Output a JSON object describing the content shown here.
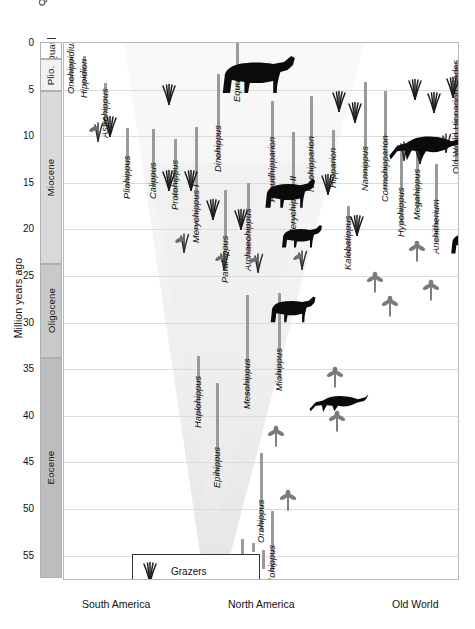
{
  "chart_data": {
    "type": "range_chart",
    "ylabel": "Million years ago",
    "ylim": [
      0,
      57.5
    ],
    "y_inverted": true,
    "yticks": [
      0,
      5,
      10,
      15,
      20,
      25,
      30,
      35,
      40,
      45,
      50,
      55
    ],
    "grid": true,
    "legend_position": "bottom-left",
    "xlabel": "",
    "x_regions": [
      "South America",
      "North America",
      "Old World"
    ],
    "epochs": [
      {
        "name": "Quat.",
        "start": 0.0,
        "end": 1.8,
        "shade": "#ffffff"
      },
      {
        "name": "Plio.",
        "start": 1.8,
        "end": 5.3,
        "shade": "#f2f2f2"
      },
      {
        "name": "Miocene",
        "start": 5.3,
        "end": 23.8,
        "shade": "#d9d9d9"
      },
      {
        "name": "Oligocene",
        "start": 23.8,
        "end": 33.9,
        "shade": "#c9c9c9"
      },
      {
        "name": "Eocene",
        "start": 33.9,
        "end": 57.5,
        "shade": "#bdbdbd"
      }
    ],
    "legend": [
      {
        "key": "grazers",
        "label": "Grazers"
      },
      {
        "key": "mixed",
        "label": "Mixed"
      },
      {
        "key": "browsers",
        "label": "Browsers"
      }
    ],
    "taxa": [
      {
        "name": "Onohippidium",
        "region": "South America",
        "x": 6,
        "top": 4.2,
        "bottom": 1.5,
        "diet": "mixed"
      },
      {
        "name": "Hippidion",
        "region": "South America",
        "x": 19,
        "top": 4.6,
        "bottom": 1.4,
        "diet": "grazers"
      },
      {
        "name": "Astrohippus",
        "region": "South America",
        "x": 40,
        "top": 8.9,
        "bottom": 4.3,
        "diet": "grazers"
      },
      {
        "name": "Pliohippus",
        "region": "South America",
        "x": 62,
        "top": 15.4,
        "bottom": 9.1,
        "diet": "grazers"
      },
      {
        "name": "Calippus",
        "region": "South America",
        "x": 88,
        "top": 15.5,
        "bottom": 9.2,
        "diet": "grazers"
      },
      {
        "name": "Protohippus",
        "region": "South America",
        "x": 110,
        "top": 16.6,
        "bottom": 10.3,
        "diet": "grazers"
      },
      {
        "name": "Merychippus I",
        "region": "North America",
        "x": 131,
        "top": 20.2,
        "bottom": 9.0,
        "diet": "mixed"
      },
      {
        "name": "Dinohippus",
        "region": "North America",
        "x": 153,
        "top": 12.5,
        "bottom": 3.3,
        "diet": "grazers"
      },
      {
        "name": "Equus",
        "region": "North America",
        "x": 172,
        "top": 5.0,
        "bottom": 0.0,
        "diet": "grazers"
      },
      {
        "name": "Parahippus",
        "region": "North America",
        "x": 160,
        "top": 24.5,
        "bottom": 15.8,
        "diet": "mixed"
      },
      {
        "name": "Archaeohippus",
        "region": "North America",
        "x": 183,
        "top": 23.2,
        "bottom": 15.0,
        "diet": "mixed"
      },
      {
        "name": "Pseudhipparion",
        "region": "North America",
        "x": 207,
        "top": 15.8,
        "bottom": 6.2,
        "diet": "grazers"
      },
      {
        "name": "Merychippus II",
        "region": "North America",
        "x": 228,
        "top": 19.5,
        "bottom": 9.5,
        "diet": "grazers"
      },
      {
        "name": "Neohipparion",
        "region": "North America",
        "x": 246,
        "top": 14.7,
        "bottom": 5.7,
        "diet": "grazers"
      },
      {
        "name": "Hipparion",
        "region": "North America",
        "x": 268,
        "top": 14.3,
        "bottom": 9.3,
        "diet": "grazers"
      },
      {
        "name": "Kalobatippus",
        "region": "North America",
        "x": 283,
        "top": 23.1,
        "bottom": 17.5,
        "diet": "browsers"
      },
      {
        "name": "Nannippus",
        "region": "North America",
        "x": 300,
        "top": 14.6,
        "bottom": 4.2,
        "diet": "grazers"
      },
      {
        "name": "Cormohipparion",
        "region": "Old World",
        "x": 320,
        "top": 15.8,
        "bottom": 5.2,
        "diet": "grazers"
      },
      {
        "name": "Hypohippus",
        "region": "Old World",
        "x": 336,
        "top": 19.5,
        "bottom": 11.0,
        "diet": "browsers"
      },
      {
        "name": "Megahippus",
        "region": "Old World",
        "x": 352,
        "top": 17.7,
        "bottom": 11.4,
        "diet": "browsers"
      },
      {
        "name": "Anchitherium",
        "region": "Old World",
        "x": 371,
        "top": 21.3,
        "bottom": 13.0,
        "diet": "browsers"
      },
      {
        "name": "Old World Hipparion clades",
        "region": "Old World",
        "x": 391,
        "top": 12.8,
        "bottom": 2.0,
        "diet": "grazers",
        "upright": true
      },
      {
        "name": "Sinohippus",
        "region": "Old World",
        "x": 424,
        "top": 19.3,
        "bottom": 13.2,
        "diet": "browsers"
      },
      {
        "name": "Haplohippus",
        "region": "North America",
        "x": 133,
        "top": 40.0,
        "bottom": 33.6,
        "diet": "browsers"
      },
      {
        "name": "Epihippus",
        "region": "North America",
        "x": 152,
        "top": 46.5,
        "bottom": 36.5,
        "diet": "browsers"
      },
      {
        "name": "Mesohippus",
        "region": "North America",
        "x": 182,
        "top": 38.0,
        "bottom": 27.0,
        "diet": "browsers"
      },
      {
        "name": "Orohippus",
        "region": "North America",
        "x": 196,
        "top": 52.3,
        "bottom": 44.0,
        "diet": "browsers"
      },
      {
        "name": "Miohippus",
        "region": "North America",
        "x": 214,
        "top": 36.0,
        "bottom": 26.8,
        "diet": "browsers"
      },
      {
        "name": "Eohippus",
        "region": "North America",
        "x": 207,
        "top": 56.8,
        "bottom": 50.2,
        "diet": "browsers"
      }
    ],
    "extra_bars": [
      {
        "x": 177,
        "top": 53.2,
        "bottom": 56.0
      },
      {
        "x": 188,
        "top": 53.6,
        "bottom": 54.6
      },
      {
        "x": 198,
        "top": 54.4,
        "bottom": 56.4
      }
    ],
    "horse_silhouettes": [
      {
        "x": 148,
        "y": 8,
        "w": 90,
        "h": 46,
        "pose": "standing-large"
      },
      {
        "x": 322,
        "y": 80,
        "w": 80,
        "h": 42,
        "pose": "running"
      },
      {
        "x": 194,
        "y": 132,
        "w": 62,
        "h": 36,
        "pose": "standing"
      },
      {
        "x": 212,
        "y": 179,
        "w": 50,
        "h": 28,
        "pose": "standing-small"
      },
      {
        "x": 381,
        "y": 183,
        "w": 52,
        "h": 30,
        "pose": "standing-small"
      },
      {
        "x": 200,
        "y": 250,
        "w": 56,
        "h": 32,
        "pose": "standing-small"
      },
      {
        "x": 243,
        "y": 344,
        "w": 62,
        "h": 28,
        "pose": "running-small"
      },
      {
        "x": 240,
        "y": 548,
        "w": 42,
        "h": 20,
        "pose": "running-tiny"
      }
    ],
    "diet_icons": [
      {
        "x": 96,
        "y": 40,
        "diet": "grazers"
      },
      {
        "x": 266,
        "y": 47,
        "diet": "grazers"
      },
      {
        "x": 282,
        "y": 58,
        "diet": "grazers"
      },
      {
        "x": 342,
        "y": 35,
        "diet": "grazers"
      },
      {
        "x": 361,
        "y": 48,
        "diet": "grazers"
      },
      {
        "x": 380,
        "y": 33,
        "diet": "grazers"
      },
      {
        "x": 441,
        "y": 52,
        "diet": "grazers"
      },
      {
        "x": 24,
        "y": 77,
        "diet": "mixed"
      },
      {
        "x": 37,
        "y": 72,
        "diet": "grazers"
      },
      {
        "x": 96,
        "y": 126,
        "diet": "grazers"
      },
      {
        "x": 118,
        "y": 126,
        "diet": "grazers"
      },
      {
        "x": 140,
        "y": 155,
        "diet": "grazers"
      },
      {
        "x": 168,
        "y": 165,
        "diet": "grazers"
      },
      {
        "x": 255,
        "y": 130,
        "diet": "grazers"
      },
      {
        "x": 284,
        "y": 171,
        "diet": "grazers"
      },
      {
        "x": 330,
        "y": 96,
        "diet": "mixed"
      },
      {
        "x": 347,
        "y": 99,
        "diet": "grazers"
      },
      {
        "x": 372,
        "y": 88,
        "diet": "mixed"
      },
      {
        "x": 417,
        "y": 95,
        "diet": "grazers"
      },
      {
        "x": 432,
        "y": 117,
        "diet": "mixed"
      },
      {
        "x": 110,
        "y": 188,
        "diet": "mixed"
      },
      {
        "x": 150,
        "y": 206,
        "diet": "mixed"
      },
      {
        "x": 184,
        "y": 208,
        "diet": "mixed"
      },
      {
        "x": 228,
        "y": 205,
        "diet": "mixed"
      },
      {
        "x": 302,
        "y": 228,
        "diet": "browsers"
      },
      {
        "x": 344,
        "y": 197,
        "diet": "browsers"
      },
      {
        "x": 358,
        "y": 236,
        "diet": "browsers"
      },
      {
        "x": 396,
        "y": 207,
        "diet": "browsers"
      },
      {
        "x": 429,
        "y": 191,
        "diet": "browsers"
      },
      {
        "x": 317,
        "y": 252,
        "diet": "browsers"
      },
      {
        "x": 262,
        "y": 323,
        "diet": "browsers"
      },
      {
        "x": 264,
        "y": 367,
        "diet": "browsers"
      },
      {
        "x": 203,
        "y": 382,
        "diet": "browsers"
      },
      {
        "x": 215,
        "y": 446,
        "diet": "browsers"
      },
      {
        "x": 339,
        "y": 553,
        "diet": "browsers"
      }
    ]
  },
  "regions": {
    "south_america": "South America",
    "north_america": "North America",
    "old_world": "Old World"
  },
  "axis": {
    "title": "Million years ago",
    "quat_label": "Quat."
  }
}
